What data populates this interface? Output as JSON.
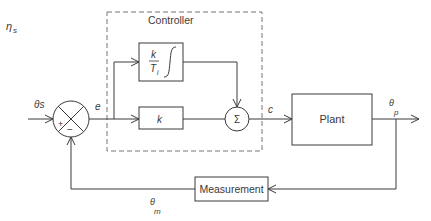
{
  "diagram": {
    "type": "control-block-diagram",
    "corner_label": "η s",
    "corner_label_main": "η",
    "corner_label_sub": "s",
    "controller_label": "Controller",
    "integral_block": {
      "numerator": "k",
      "denominator": "T",
      "denominator_sub": "i",
      "integral_symbol": "∫"
    },
    "proportional_block": {
      "label": "k"
    },
    "sum_block": {
      "label": "Σ"
    },
    "plant_block": {
      "label": "Plant"
    },
    "measurement_block": {
      "label": "Measurement"
    },
    "comparator": {
      "plus": "+",
      "minus": "−"
    },
    "signals": {
      "setpoint": "θs",
      "error": "e",
      "control": "c",
      "output_main": "θ",
      "output_sub": "p",
      "measured_main": "θ",
      "measured_sub": "m"
    },
    "colors": {
      "line": "#3a3a3a",
      "dashed": "#777777"
    }
  }
}
